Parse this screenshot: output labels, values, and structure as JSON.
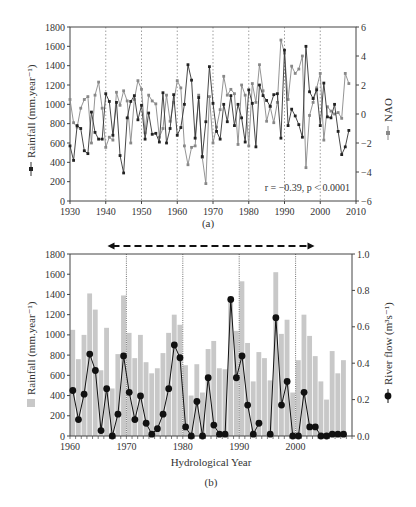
{
  "chart_data": [
    {
      "panel": "a",
      "type": "line",
      "caption": "(a)",
      "xlabel": "",
      "ylabel": "Rainfall (mm.year⁻¹)",
      "y2label": "NAO",
      "xlim": [
        1930,
        2010
      ],
      "ylim": [
        0,
        1800
      ],
      "y2lim": [
        -6,
        6
      ],
      "xticks": [
        "1930",
        "1940",
        "1950",
        "1960",
        "1970",
        "1980",
        "1990",
        "2000",
        "2010"
      ],
      "yticks": [
        "0",
        "200",
        "400",
        "600",
        "800",
        "1000",
        "1200",
        "1400",
        "1600",
        "1800"
      ],
      "y2ticks": [
        "6",
        "4",
        "2",
        "0",
        "−2",
        "−4",
        "−6"
      ],
      "vlines": [
        1940,
        1950,
        1960,
        1970,
        1980,
        1990,
        2000
      ],
      "annotation": "r = −0.39, p < 0.0001",
      "series": [
        {
          "name": "Rainfall",
          "axis": "left",
          "marker": "circle-dark",
          "x": [
            1930,
            1931,
            1932,
            1933,
            1934,
            1935,
            1936,
            1937,
            1938,
            1939,
            1940,
            1941,
            1942,
            1943,
            1944,
            1945,
            1946,
            1947,
            1948,
            1949,
            1950,
            1951,
            1952,
            1953,
            1954,
            1955,
            1956,
            1957,
            1958,
            1959,
            1960,
            1961,
            1962,
            1963,
            1964,
            1965,
            1966,
            1967,
            1968,
            1969,
            1970,
            1971,
            1972,
            1973,
            1974,
            1975,
            1976,
            1977,
            1978,
            1979,
            1980,
            1981,
            1982,
            1983,
            1984,
            1985,
            1986,
            1987,
            1988,
            1989,
            1990,
            1991,
            1992,
            1993,
            1994,
            1995,
            1996,
            1997,
            1998,
            1999,
            2000,
            2001,
            2002,
            2003,
            2004,
            2005,
            2006,
            2007,
            2008
          ],
          "values": [
            570,
            420,
            780,
            750,
            520,
            490,
            920,
            710,
            640,
            640,
            1110,
            1030,
            680,
            1020,
            470,
            290,
            860,
            1030,
            1090,
            840,
            990,
            640,
            910,
            690,
            700,
            610,
            1120,
            600,
            750,
            1100,
            680,
            760,
            1000,
            1410,
            1250,
            650,
            1070,
            460,
            820,
            1390,
            1010,
            720,
            640,
            1000,
            820,
            1090,
            780,
            1000,
            860,
            610,
            1150,
            1010,
            560,
            1200,
            1090,
            1040,
            980,
            1100,
            1110,
            650,
            1560,
            780,
            950,
            880,
            790,
            660,
            1600,
            1130,
            1060,
            1150,
            780,
            1220,
            870,
            860,
            1000,
            720,
            480,
            560,
            730
          ],
          "note": "approximate values read from markers"
        },
        {
          "name": "NAO",
          "axis": "right",
          "marker": "square-grey",
          "x": [
            1930,
            1931,
            1932,
            1933,
            1934,
            1935,
            1936,
            1937,
            1938,
            1939,
            1940,
            1941,
            1942,
            1943,
            1944,
            1945,
            1946,
            1947,
            1948,
            1949,
            1950,
            1951,
            1952,
            1953,
            1954,
            1955,
            1956,
            1957,
            1958,
            1959,
            1960,
            1961,
            1962,
            1963,
            1964,
            1965,
            1966,
            1967,
            1968,
            1969,
            1970,
            1971,
            1972,
            1973,
            1974,
            1975,
            1976,
            1977,
            1978,
            1979,
            1980,
            1981,
            1982,
            1983,
            1984,
            1985,
            1986,
            1987,
            1988,
            1989,
            1990,
            1991,
            1992,
            1993,
            1994,
            1995,
            1996,
            1997,
            1998,
            1999,
            2000,
            2001,
            2002,
            2003,
            2004,
            2005,
            2006,
            2007,
            2008
          ],
          "values": [
            1.0,
            -0.6,
            -0.9,
            0.4,
            1.0,
            1.2,
            -2.0,
            1.3,
            2.2,
            0.4,
            -2.3,
            -1.6,
            -1.8,
            1.5,
            0.6,
            1.6,
            0.9,
            -2.0,
            1.0,
            2.3,
            1.7,
            -1.3,
            1.3,
            0.9,
            0.7,
            -1.6,
            -1.0,
            1.3,
            -0.5,
            0.8,
            2.3,
            1.8,
            -2.2,
            -3.5,
            -2.3,
            -2.2,
            1.3,
            -3.0,
            -4.8,
            1.2,
            -2.0,
            -0.9,
            0.3,
            2.6,
            1.3,
            1.7,
            1.4,
            -2.1,
            2.0,
            1.3,
            -2.2,
            2.1,
            0.8,
            3.4,
            1.6,
            -0.5,
            0.5,
            -0.6,
            0.8,
            5.1,
            4.2,
            1.0,
            3.3,
            2.8,
            3.1,
            4.0,
            -3.7,
            -0.1,
            0.8,
            1.8,
            2.8,
            -1.8,
            0.5,
            0.2,
            0.0,
            0.1,
            -0.3,
            2.8,
            2.1
          ]
        }
      ]
    },
    {
      "panel": "b",
      "type": "bar+line",
      "caption": "(b)",
      "xlabel": "Hydrological Year",
      "ylabel": "Rainfall (mm.year⁻¹)",
      "y2label": "River flow (m³s⁻¹)",
      "xlim": [
        1960,
        2010
      ],
      "ylim": [
        0,
        1800
      ],
      "y2lim": [
        0,
        1.0
      ],
      "xticks": [
        "1960",
        "1970",
        "1980",
        "1990",
        "2000"
      ],
      "yticks": [
        "0",
        "200",
        "400",
        "600",
        "800",
        "1000",
        "1200",
        "1400",
        "1600",
        "1800"
      ],
      "y2ticks": [
        "0.0",
        "0.2",
        "0.4",
        "0.6",
        "0.8",
        "1.0"
      ],
      "vlines": [
        1970,
        1980,
        1990,
        2000
      ],
      "arrow": {
        "from": 1967,
        "to": 2003,
        "style": "dashed double-headed"
      },
      "categories": [
        1960,
        1961,
        1962,
        1963,
        1964,
        1965,
        1966,
        1967,
        1968,
        1969,
        1970,
        1971,
        1972,
        1973,
        1974,
        1975,
        1976,
        1977,
        1978,
        1979,
        1980,
        1981,
        1982,
        1983,
        1984,
        1985,
        1986,
        1987,
        1988,
        1989,
        1990,
        1991,
        1992,
        1993,
        1994,
        1995,
        1996,
        1997,
        1998,
        1999,
        2000,
        2001,
        2002,
        2003,
        2004,
        2005,
        2006,
        2007,
        2008
      ],
      "series": [
        {
          "name": "Rainfall",
          "type": "bar",
          "axis": "left",
          "color": "#c8c8c8",
          "values": [
            1050,
            760,
            1000,
            1410,
            1250,
            650,
            1070,
            470,
            810,
            1390,
            1020,
            770,
            1000,
            730,
            620,
            670,
            820,
            1020,
            1200,
            1100,
            700,
            400,
            710,
            430,
            860,
            940,
            670,
            660,
            1320,
            1040,
            1530,
            920,
            540,
            830,
            770,
            550,
            1620,
            1010,
            1150,
            430,
            750,
            1200,
            990,
            790,
            540,
            360,
            840,
            620,
            750
          ]
        },
        {
          "name": "River flow",
          "type": "line",
          "axis": "right",
          "marker": "circle-black",
          "values": [
            0.25,
            0.09,
            0.23,
            0.45,
            0.36,
            0.03,
            0.26,
            0.0,
            0.12,
            0.44,
            0.24,
            0.09,
            0.22,
            0.07,
            0.01,
            0.04,
            0.12,
            0.26,
            0.5,
            0.43,
            0.05,
            0.0,
            0.19,
            0.0,
            0.32,
            0.06,
            0.01,
            0.01,
            0.75,
            0.32,
            0.44,
            0.17,
            0.01,
            0.07,
            null,
            0.01,
            0.65,
            0.17,
            0.3,
            0.0,
            0.0,
            0.24,
            0.05,
            0.05,
            0.0,
            0.0,
            0.01,
            0.01,
            0.01
          ]
        }
      ]
    }
  ]
}
